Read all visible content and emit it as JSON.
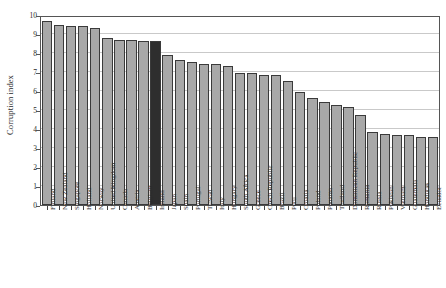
{
  "chart_data": {
    "type": "bar",
    "title": "",
    "subtitle": "",
    "xlabel": "",
    "ylabel": "Corruption index",
    "ylim": [
      0,
      10
    ],
    "ytick_labels": [
      "0",
      "1",
      "2",
      "3",
      "4",
      "5",
      "6",
      "7",
      "8",
      "9",
      "10"
    ],
    "ytick_values": [
      0,
      1,
      2,
      3,
      4,
      5,
      6,
      7,
      8,
      9,
      10
    ],
    "grid": "horizontal",
    "legend": "none",
    "series_colors": {
      "light": "#a8a8a8",
      "dark": "#2e2e2e",
      "border": "#3a3a3a",
      "gridline": "#c9c9c9",
      "frame": "#555555",
      "text": "#2b2b2b"
    },
    "categories": [
      "Finland",
      "New Zealand",
      "Singapore",
      "Holland",
      "Norway",
      "United Kingdom",
      "Canada",
      "Austria",
      "Belgium",
      "Ireland",
      "Japan",
      "Spain",
      "Portugal",
      "Taiwan",
      "Italy",
      "Hungary",
      "South Africa",
      "Greece",
      "Czech Republic",
      "Brazil",
      "Peru",
      "Croatia",
      "Poland",
      "Panama",
      "Thailand",
      "Dominican Republic",
      "Romania",
      "Russia",
      "Pakistan",
      "Vietnam",
      "Guatemala",
      "Honduras",
      "Ecuador"
    ],
    "values": [
      9.8,
      9.6,
      9.5,
      9.5,
      9.4,
      8.9,
      8.8,
      8.8,
      8.7,
      8.7,
      8.0,
      7.7,
      7.6,
      7.5,
      7.5,
      7.4,
      7.0,
      7.0,
      6.9,
      6.9,
      6.6,
      6.0,
      5.7,
      5.5,
      5.3,
      5.2,
      4.8,
      3.9,
      3.8,
      3.7,
      3.7,
      3.6,
      3.6
    ],
    "shades": [
      "light",
      "light",
      "light",
      "light",
      "light",
      "light",
      "light",
      "light",
      "light",
      "dark",
      "light",
      "light",
      "light",
      "light",
      "light",
      "light",
      "light",
      "light",
      "light",
      "light",
      "light",
      "light",
      "light",
      "light",
      "light",
      "light",
      "light",
      "light",
      "light",
      "light",
      "light",
      "light",
      "light"
    ]
  }
}
